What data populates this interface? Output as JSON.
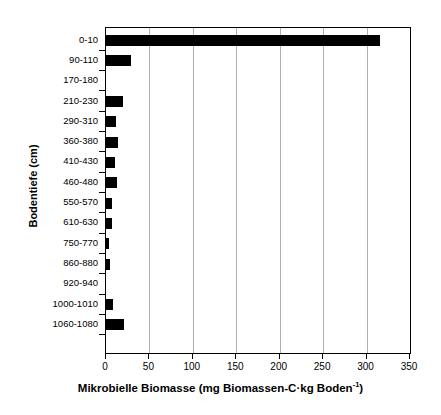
{
  "chart_data": {
    "type": "bar",
    "orientation": "horizontal",
    "title": "",
    "xlabel": "Mikrobielle Biomasse (mg Biomassen-C·kg Boden⁻¹)",
    "ylabel": "Bodentiefe (cm)",
    "categories": [
      "0-10",
      "90-110",
      "170-180",
      "210-230",
      "290-310",
      "360-380",
      "410-430",
      "460-480",
      "550-570",
      "610-630",
      "750-770",
      "860-880",
      "920-940",
      "1000-1010",
      "1060-1080"
    ],
    "values": [
      315,
      29,
      0,
      19,
      11,
      14,
      10,
      13,
      7,
      7,
      3,
      5,
      0,
      8,
      21
    ],
    "xlim": [
      0,
      350
    ],
    "xticks": [
      0,
      50,
      100,
      150,
      200,
      250,
      300,
      350
    ],
    "xtick_labels": [
      "0",
      "50",
      "100",
      "150",
      "200",
      "250",
      "300",
      "350"
    ],
    "grid": "vertical",
    "grid_color": "#b0b0b0",
    "bar_color": "#000000",
    "legend": "none",
    "background": "#ffffff",
    "axis_color": "#000000"
  },
  "axis_title_parts": {
    "x_main": "Mikrobielle Biomasse (mg Biomassen-C",
    "x_dot": "·",
    "x_mid": "kg Boden",
    "x_sup": "-1",
    "x_end": ")"
  }
}
